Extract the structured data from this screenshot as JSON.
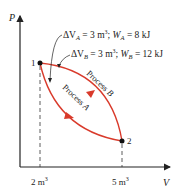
{
  "axes": {
    "y_label": "P",
    "x_label": "V",
    "x_ticks": [
      {
        "label": "2 m",
        "sup": "3"
      },
      {
        "label": "5 m",
        "sup": "3"
      }
    ]
  },
  "points": [
    {
      "label": "1"
    },
    {
      "label": "2"
    }
  ],
  "processes": [
    {
      "name": "Process A",
      "word": "Process",
      "letter": "A"
    },
    {
      "name": "Process B",
      "word": "Process",
      "letter": "B"
    }
  ],
  "annotations": {
    "a": {
      "dv": "ΔV",
      "dv_sub": "A",
      "dv_val": " = 3 m",
      "dv_sup": "3",
      "sep": "; ",
      "w": "W",
      "w_sub": "A",
      "w_val": " = 8 kJ"
    },
    "b": {
      "dv": "ΔV",
      "dv_sub": "B",
      "dv_val": " = 3 m",
      "dv_sup": "3",
      "sep": "; ",
      "w": "W",
      "w_sub": "B",
      "w_val": " = 12 kJ"
    }
  },
  "colors": {
    "curve": "#d93a2b",
    "axis": "#222222"
  }
}
